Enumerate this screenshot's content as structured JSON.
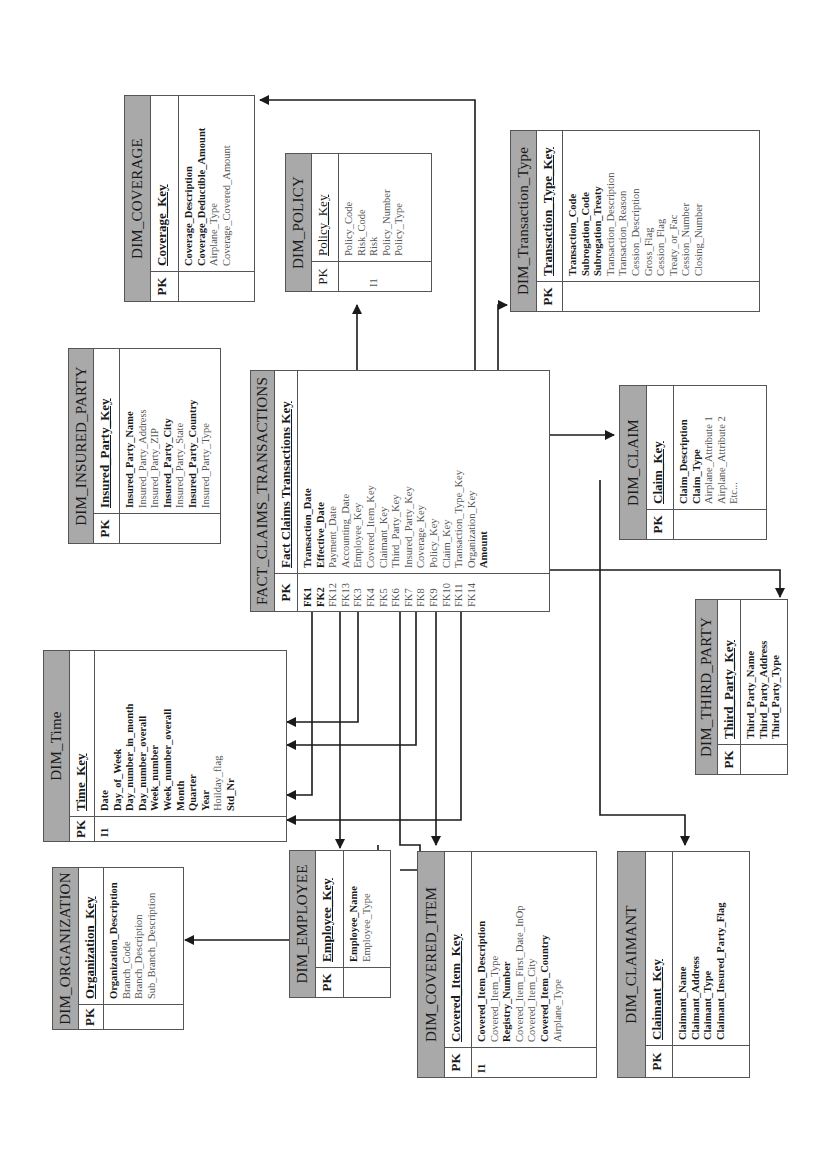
{
  "diagram": {
    "orientation": "rotated 90 degrees counter-clockwise",
    "colors": {
      "header_fill": "#a9a9a9",
      "border": "#555555",
      "line": "#1a1a1a"
    }
  },
  "tables": {
    "fact_claims_transactions": {
      "title": "FACT_CLAIMS_TRANSACTIONS",
      "pk_label": "PK",
      "key": "Fact Claims Transactions Key",
      "fk_labels": [
        "FK1",
        "FK2",
        "FK12",
        "FK13",
        "FK3",
        "FK4",
        "FK5",
        "FK6",
        "FK7",
        "FK8",
        "FK9",
        "FK10",
        "FK11",
        "FK14",
        ""
      ],
      "attributes": [
        {
          "name": "Transaction_Date",
          "bold": true
        },
        {
          "name": "Effective_Date",
          "bold": true
        },
        {
          "name": "Payment_Date",
          "bold": false
        },
        {
          "name": "Accounting_Date",
          "bold": false
        },
        {
          "name": "Employee_Key",
          "bold": false
        },
        {
          "name": "Covered_Item_Key",
          "bold": false
        },
        {
          "name": "Claimant_Key",
          "bold": false
        },
        {
          "name": "Third_Party_Key",
          "bold": false
        },
        {
          "name": "Insured_Party_Key",
          "bold": false
        },
        {
          "name": "Coverage_Key",
          "bold": false
        },
        {
          "name": "Policy_Key",
          "bold": false
        },
        {
          "name": "Claim_Key",
          "bold": false
        },
        {
          "name": "Transaction_Type_Key",
          "bold": false
        },
        {
          "name": "Organization_Key",
          "bold": false
        },
        {
          "name": "Amount",
          "bold": true
        }
      ]
    },
    "dim_time": {
      "title": "DIM_Time",
      "pk_label": "PK",
      "key": "Time_Key",
      "index_label": "I1",
      "attributes": [
        {
          "name": "Date",
          "bold": true
        },
        {
          "name": "Day_of_Week",
          "bold": true
        },
        {
          "name": "Day_number_in_month",
          "bold": true
        },
        {
          "name": "Day_number_overall",
          "bold": true
        },
        {
          "name": "Week_number",
          "bold": true
        },
        {
          "name": "Week_number_overall",
          "bold": true
        },
        {
          "name": "Month",
          "bold": true
        },
        {
          "name": "Quarter",
          "bold": true
        },
        {
          "name": "Year",
          "bold": true
        },
        {
          "name": "Hoilday_flag",
          "bold": false
        },
        {
          "name": "Std_Nr",
          "bold": true
        }
      ]
    },
    "dim_organization": {
      "title": "DIM_ORGANIZATION",
      "pk_label": "PK",
      "key": "Organization_Key",
      "attributes": [
        {
          "name": "Organization_Description",
          "bold": true
        },
        {
          "name": "Branch_Code",
          "bold": false
        },
        {
          "name": "Branch_Description",
          "bold": false
        },
        {
          "name": "Sub_Branch_Description",
          "bold": false
        }
      ]
    },
    "dim_employee": {
      "title": "DIM_EMPLOYEE",
      "pk_label": "PK",
      "key": "Employee_Key",
      "attributes": [
        {
          "name": "Employee_Name",
          "bold": true
        },
        {
          "name": "Employee_Type",
          "bold": false
        }
      ]
    },
    "dim_covered_item": {
      "title": "DIM_COVERED_ITEM",
      "pk_label": "PK",
      "key": "Covered_Item_Key",
      "index_label": "I1",
      "attributes": [
        {
          "name": "Covered_Item_Description",
          "bold": true
        },
        {
          "name": "Covered_Item_Type",
          "bold": false
        },
        {
          "name": "Registry_Number",
          "bold": true
        },
        {
          "name": "Covered_Item_First_Date_InOp",
          "bold": false
        },
        {
          "name": "Covered_Item_City",
          "bold": false
        },
        {
          "name": "Covered_Item_Country",
          "bold": true
        },
        {
          "name": "Airplane_Type",
          "bold": false
        }
      ]
    },
    "dim_claimant": {
      "title": "DIM_CLAIMANT",
      "pk_label": "PK",
      "key": "Claimant_Key",
      "attributes": [
        {
          "name": "Claimant_Name",
          "bold": true
        },
        {
          "name": "Claimant_Address",
          "bold": true
        },
        {
          "name": "Claimant_Type",
          "bold": true
        },
        {
          "name": "Claimant_Insured_Party_Flag",
          "bold": true
        }
      ]
    },
    "dim_third_party": {
      "title": "DIM_THIRD_PARTY",
      "pk_label": "PK",
      "key": "Third_Party_Key",
      "attributes": [
        {
          "name": "Third_Party_Name",
          "bold": true
        },
        {
          "name": "Third_Party_Address",
          "bold": true
        },
        {
          "name": "Third_Party_Type",
          "bold": true
        }
      ]
    },
    "dim_claim": {
      "title": "DIM_CLAIM",
      "pk_label": "PK",
      "key": "Claim_Key",
      "attributes": [
        {
          "name": "Claim_Description",
          "bold": true
        },
        {
          "name": "Claim_Type",
          "bold": true
        },
        {
          "name": "Airplane_Attribute 1",
          "bold": false
        },
        {
          "name": "Airplane_Attribute 2",
          "bold": false
        },
        {
          "name": "Etc...",
          "bold": false
        }
      ]
    },
    "dim_transaction_type": {
      "title": "DIM_Transaction_Type",
      "pk_label": "PK",
      "key": "Transaction_Type_Key",
      "attributes": [
        {
          "name": "Transaction_Code",
          "bold": true
        },
        {
          "name": "Subrogation_Code",
          "bold": true
        },
        {
          "name": "Subrogation_Treaty",
          "bold": true
        },
        {
          "name": "Transaction_Description",
          "bold": false
        },
        {
          "name": "Transaction_Reason",
          "bold": false
        },
        {
          "name": "Cession_Description",
          "bold": false
        },
        {
          "name": "Gross_Flag",
          "bold": false
        },
        {
          "name": "Cession_Flag",
          "bold": false
        },
        {
          "name": "Treaty_or_Fac",
          "bold": false
        },
        {
          "name": "Cession_Number",
          "bold": false
        },
        {
          "name": "Closing_Number",
          "bold": false
        }
      ]
    },
    "dim_policy": {
      "title": "DIM_POLICY",
      "pk_label": "PK",
      "key": "Policy_Key",
      "index_label": "I1",
      "attributes": [
        {
          "name": "Policy_Code",
          "bold": false
        },
        {
          "name": "Risk_Code",
          "bold": false
        },
        {
          "name": "Risk",
          "bold": false
        },
        {
          "name": "Policy_Number",
          "bold": false
        },
        {
          "name": "Policy_Type",
          "bold": false
        }
      ]
    },
    "dim_insured_party": {
      "title": "DIM_INSURED_PARTY",
      "pk_label": "PK",
      "key": "Insured_Party_Key",
      "attributes": [
        {
          "name": "Insured_Party_Name",
          "bold": true
        },
        {
          "name": "Insured_Party_Address",
          "bold": false
        },
        {
          "name": "Insured_Party_ZIP",
          "bold": false
        },
        {
          "name": "Insured_Party_City",
          "bold": true
        },
        {
          "name": "Insured_Party_State",
          "bold": false
        },
        {
          "name": "Insured_Party_Country",
          "bold": true
        },
        {
          "name": "Insured_Party_Type",
          "bold": false
        }
      ]
    },
    "dim_coverage": {
      "title": "DIM_COVERAGE",
      "pk_label": "PK",
      "key": "Coverage_Key",
      "attributes": [
        {
          "name": "Coverage_Description",
          "bold": true
        },
        {
          "name": "Coverage_Deductible_Amount",
          "bold": true
        },
        {
          "name": "Airplane_Type",
          "bold": false
        },
        {
          "name": "Coverage_Covered_Amount",
          "bold": false
        }
      ]
    }
  }
}
